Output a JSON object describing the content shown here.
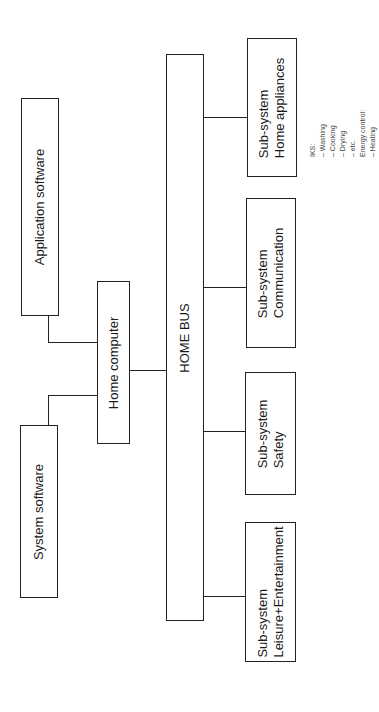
{
  "diagram": {
    "orientation": "rotated-90-ccw",
    "nodes": {
      "application_software": {
        "label": "Application software"
      },
      "system_software": {
        "label": "System software"
      },
      "home_computer": {
        "label": "Home computer"
      },
      "home_bus": {
        "label": "HOME BUS"
      },
      "subsystems": [
        {
          "line1": "Sub-system",
          "line2": "Leisure+Entertainment"
        },
        {
          "line1": "Sub-system",
          "line2": "Safety"
        },
        {
          "line1": "Sub-system",
          "line2": "Communication"
        },
        {
          "line1": "Sub-system",
          "line2": "Home appliances"
        }
      ]
    },
    "annotation": {
      "lines": [
        "IKS:",
        "– Washing",
        "– Cooking",
        "– Drying",
        "– etc.",
        "Energy control:",
        "– Heating"
      ]
    },
    "edges": [
      [
        "application_software",
        "home_computer"
      ],
      [
        "system_software",
        "home_computer"
      ],
      [
        "home_computer",
        "home_bus"
      ],
      [
        "home_bus",
        "Leisure+Entertainment"
      ],
      [
        "home_bus",
        "Safety"
      ],
      [
        "home_bus",
        "Communication"
      ],
      [
        "home_bus",
        "Home appliances"
      ]
    ]
  }
}
